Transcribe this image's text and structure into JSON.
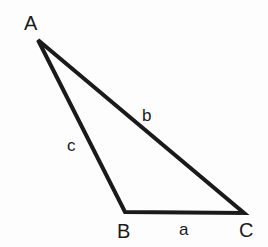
{
  "figure": {
    "background_color": "#fdfdfd",
    "stroke_color": "#1a1a1a",
    "text_color": "#1a1a1a",
    "stroke_width": 4
  },
  "vertices": [
    {
      "id": "A",
      "label": "A",
      "x": 38,
      "y": 40
    },
    {
      "id": "B",
      "label": "B",
      "x": 125,
      "y": 212
    },
    {
      "id": "C",
      "label": "C",
      "x": 244,
      "y": 213
    }
  ],
  "sides": [
    {
      "id": "a",
      "label": "a",
      "from": "B",
      "to": "C"
    },
    {
      "id": "b",
      "label": "b",
      "from": "A",
      "to": "C"
    },
    {
      "id": "c",
      "label": "c",
      "from": "A",
      "to": "B"
    }
  ],
  "labels": {
    "vertex_A": "A",
    "vertex_B": "B",
    "vertex_C": "C",
    "side_a": "a",
    "side_b": "b",
    "side_c": "c"
  }
}
